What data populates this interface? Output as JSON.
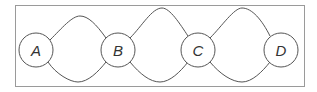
{
  "diagram": {
    "frame": {
      "x": 15,
      "y": 5,
      "width": 289,
      "height": 81,
      "stroke": "#999999"
    },
    "edge_color": "#555555",
    "nodes": [
      {
        "id": "A",
        "label": "A",
        "cx": 36,
        "cy": 50,
        "r": 17
      },
      {
        "id": "B",
        "label": "B",
        "cx": 118,
        "cy": 50,
        "r": 17
      },
      {
        "id": "C",
        "label": "C",
        "cx": 198,
        "cy": 50,
        "r": 17
      },
      {
        "id": "D",
        "label": "D",
        "cx": 281,
        "cy": 50,
        "r": 17
      }
    ],
    "edges": [
      {
        "from": "A",
        "to": "B",
        "side": "top"
      },
      {
        "from": "A",
        "to": "B",
        "side": "bottom"
      },
      {
        "from": "B",
        "to": "C",
        "side": "top"
      },
      {
        "from": "B",
        "to": "C",
        "side": "bottom"
      },
      {
        "from": "C",
        "to": "D",
        "side": "top"
      },
      {
        "from": "C",
        "to": "D",
        "side": "bottom"
      }
    ]
  }
}
